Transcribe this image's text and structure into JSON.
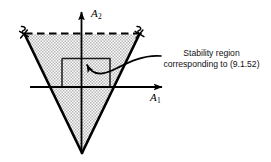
{
  "figure": {
    "name": "stability-region-diagram",
    "background_color": "#ffffff",
    "line_color": "#000000",
    "fill_color": "#d9d9d9",
    "axes": {
      "vertical": {
        "label_text": "A",
        "label_subscript": "2",
        "name": "A2"
      },
      "horizontal": {
        "label_text": "A",
        "label_subscript": "1",
        "name": "A1"
      }
    },
    "annotation": {
      "line1": "Stability region",
      "line2": "corresponding to (9.1.52)"
    },
    "region": {
      "shape": "triangle",
      "fill_pattern": "stipple",
      "top_boundary": "dashed",
      "side_boundaries": "solid",
      "open_endpoint_marks": 2
    }
  }
}
